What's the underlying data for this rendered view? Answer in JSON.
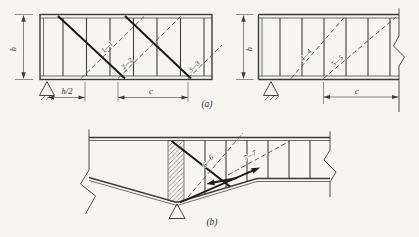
{
  "fig": {
    "dimensions": {
      "h": "h",
      "h_half": "h/2",
      "c": "c"
    },
    "sections": {
      "s1": "1—1",
      "s2": "2—2",
      "s3": "3—3",
      "s4": "4—4",
      "s5": "5—5",
      "s6": "6—6",
      "s7": "7—7"
    },
    "captions": {
      "a": "(a)",
      "b": "(b)"
    },
    "colors": {
      "background": "#f6f5f2",
      "line": "#3b3b3b",
      "crack": "#1a1a1a",
      "dashed_section_line": "#474747"
    }
  }
}
